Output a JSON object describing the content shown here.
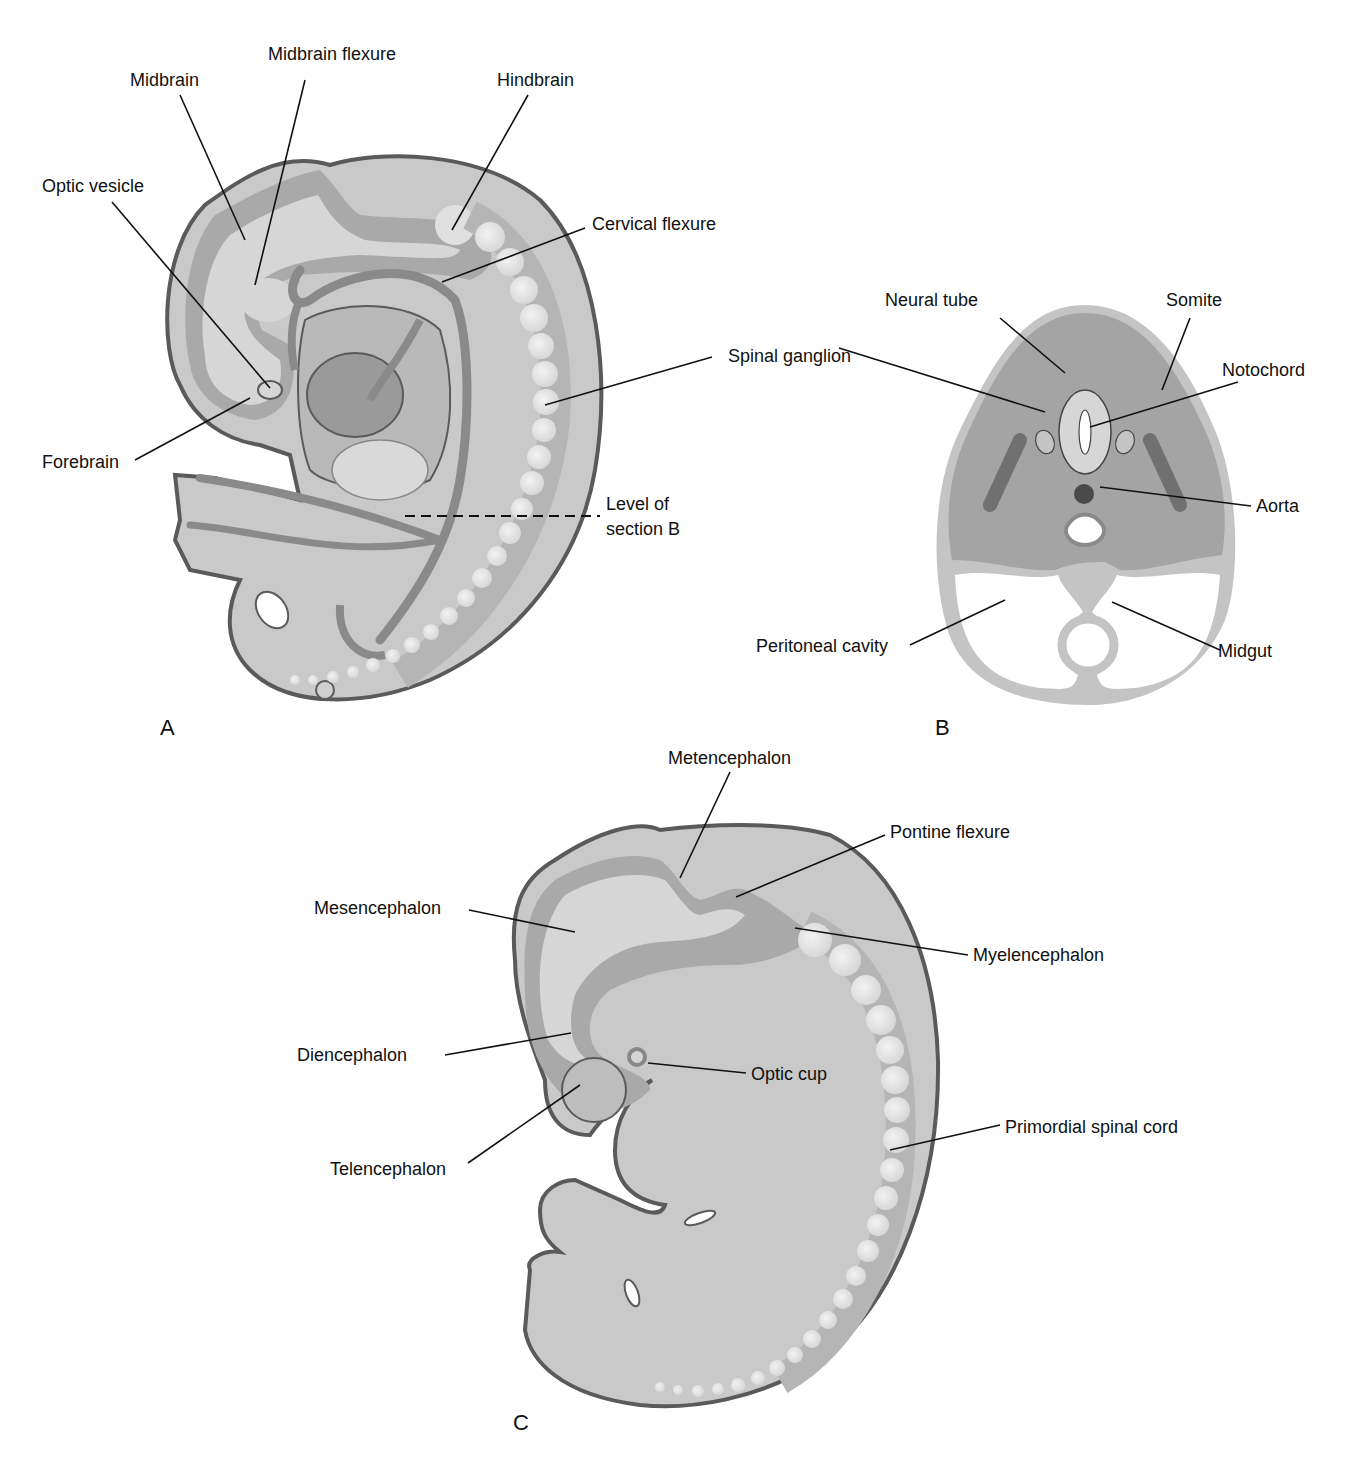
{
  "colors": {
    "body_fill": "#c9c9c9",
    "band_fill": "#a9a9a9",
    "inner_fill": "#d6d6d6",
    "outline": "#5a5a5a",
    "vessel": "#8a8a8a",
    "somite_bead": "#e6e6e6",
    "section_fill": "#a4a4a4",
    "section_rim": "#c4c4c4",
    "notochord": "#4a4a4a",
    "label_text": "#111111"
  },
  "panels": {
    "A": {
      "letter": "A",
      "labels": {
        "midbrain": "Midbrain",
        "midbrain_flexure": "Midbrain flexure",
        "hindbrain": "Hindbrain",
        "optic_vesicle": "Optic vesicle",
        "cervical_flexure": "Cervical flexure",
        "spinal_ganglion": "Spinal ganglion",
        "forebrain": "Forebrain",
        "level_of_section_line1": "Level of",
        "level_of_section_line2": "section B"
      }
    },
    "B": {
      "letter": "B",
      "labels": {
        "neural_tube": "Neural tube",
        "somite": "Somite",
        "notochord": "Notochord",
        "aorta": "Aorta",
        "peritoneal_cavity": "Peritoneal cavity",
        "midgut": "Midgut"
      }
    },
    "C": {
      "letter": "C",
      "labels": {
        "metencephalon": "Metencephalon",
        "pontine_flexure": "Pontine flexure",
        "mesencephalon": "Mesencephalon",
        "myelencephalon": "Myelencephalon",
        "diencephalon": "Diencephalon",
        "optic_cup": "Optic cup",
        "primordial_spinal_cord": "Primordial spinal cord",
        "telencephalon": "Telencephalon"
      }
    }
  }
}
